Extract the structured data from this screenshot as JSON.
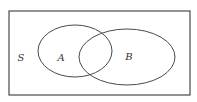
{
  "diagram": {
    "type": "venn",
    "universe": {
      "label": "S",
      "rect": {
        "x": 9,
        "y": 11,
        "width": 181,
        "height": 84
      },
      "label_pos": {
        "x": 21,
        "y": 61
      }
    },
    "sets": [
      {
        "label": "A",
        "ellipse": {
          "cx": 75,
          "cy": 51,
          "rx": 37,
          "ry": 26
        },
        "label_pos": {
          "x": 61,
          "y": 61
        }
      },
      {
        "label": "B",
        "ellipse": {
          "cx": 127,
          "cy": 57,
          "rx": 48,
          "ry": 28
        },
        "label_pos": {
          "x": 129,
          "y": 60
        }
      }
    ],
    "colors": {
      "stroke": "#4a4a4a",
      "background": "#ffffff",
      "text": "#333333"
    }
  }
}
